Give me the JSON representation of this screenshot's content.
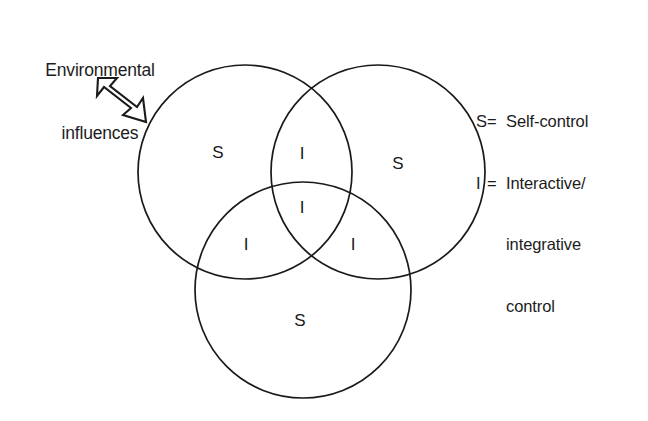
{
  "figure": {
    "type": "venn-diagram",
    "background_color": "#ffffff",
    "stroke_color": "#1a1a1a",
    "text_color": "#1a1a1a"
  },
  "annotation": {
    "caption_line1": "Environmental",
    "caption_line2": "influences",
    "arrow_icon_name": "down-right-arrow-icon",
    "arrow_direction": "down-right"
  },
  "legend": {
    "rows": [
      {
        "key": "S",
        "equals": "=",
        "text": "Self-control"
      },
      {
        "key": "I",
        "equals": "=",
        "text": "Interactive/"
      }
    ],
    "continuation": [
      "integrative",
      "control"
    ]
  },
  "venn": {
    "circles": [
      {
        "name": "top-left-circle",
        "cx": 245,
        "cy": 172,
        "r": 107
      },
      {
        "name": "top-right-circle",
        "cx": 378,
        "cy": 172,
        "r": 107
      },
      {
        "name": "bottom-circle",
        "cx": 303,
        "cy": 290,
        "r": 108
      }
    ],
    "regions": [
      {
        "name": "top-left-only",
        "label": "S",
        "x": 218,
        "y": 152
      },
      {
        "name": "top-right-only",
        "label": "S",
        "x": 398,
        "y": 163
      },
      {
        "name": "bottom-only",
        "label": "S",
        "x": 300,
        "y": 320
      },
      {
        "name": "top-left-and-top-right",
        "label": "I",
        "x": 302,
        "y": 153
      },
      {
        "name": "center-all-three",
        "label": "I",
        "x": 302,
        "y": 207
      },
      {
        "name": "top-left-and-bottom",
        "label": "I",
        "x": 246,
        "y": 244
      },
      {
        "name": "top-right-and-bottom",
        "label": "I",
        "x": 353,
        "y": 244
      }
    ]
  }
}
